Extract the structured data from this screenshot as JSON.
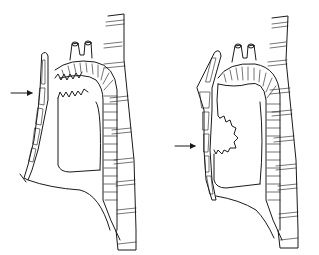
{
  "figure": {
    "type": "anatomical line illustration",
    "panels": [
      {
        "id": "left",
        "description": "Sagittal view of mediastinum with sternum, aortic arch, trachea/esophagus; arrow points at sternum level near upper lesion outline",
        "arrow": {
          "direction": "right",
          "label": ""
        },
        "lesion_position": "upper anterior mediastinum"
      },
      {
        "id": "right",
        "description": "Sagittal view of mediastinum with sternum, aortic arch, trachea/esophagus; arrow points at sternum level near mid lesion outline",
        "arrow": {
          "direction": "right",
          "label": ""
        },
        "lesion_position": "mid anterior mediastinum"
      }
    ],
    "colors": {
      "line": "#1a1a1a",
      "background": "#ffffff"
    }
  }
}
